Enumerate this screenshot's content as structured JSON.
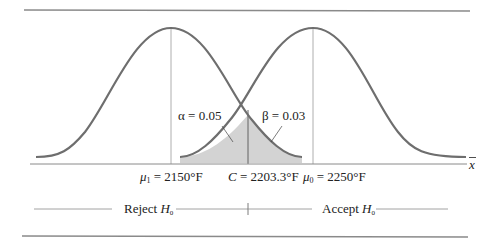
{
  "figure": {
    "left_curve": {
      "mean_label": "μ₁",
      "mean_value": "2150°F",
      "role": "H1 distribution"
    },
    "right_curve": {
      "mean_label": "μ₀",
      "mean_value": "2250°F",
      "role": "H0 distribution"
    },
    "critical_value": {
      "label": "C",
      "value": "2203.3°F"
    },
    "alpha": {
      "symbol": "α",
      "value": "0.05"
    },
    "beta": {
      "symbol": "β",
      "value": "0.03"
    },
    "x_axis_label": "x̄",
    "regions": {
      "reject": {
        "text": "Reject",
        "hypothesis": "H",
        "sub": "0"
      },
      "accept": {
        "text": "Accept",
        "hypothesis": "H",
        "sub": "0"
      }
    },
    "colors": {
      "curve": "#6e6e6e",
      "shade": "#d3d3d3",
      "rule": "#8a8a8a",
      "thin_line": "#9a9a9a",
      "text": "#222222"
    }
  },
  "labels": {
    "alpha_text": "α = 0.05",
    "beta_text": "β = 0.03",
    "mu1_sym": "μ",
    "mu1_sub": "1",
    "mu1_rest": " = 2150°F",
    "c_sym": "C",
    "c_rest": " = 2203.3°F",
    "mu0_sym": "μ",
    "mu0_sub": "0",
    "mu0_rest": " = 2250°F",
    "xbar": "x",
    "reject_word": "Reject ",
    "accept_word": "Accept ",
    "h": "H",
    "h_sub": "0"
  }
}
